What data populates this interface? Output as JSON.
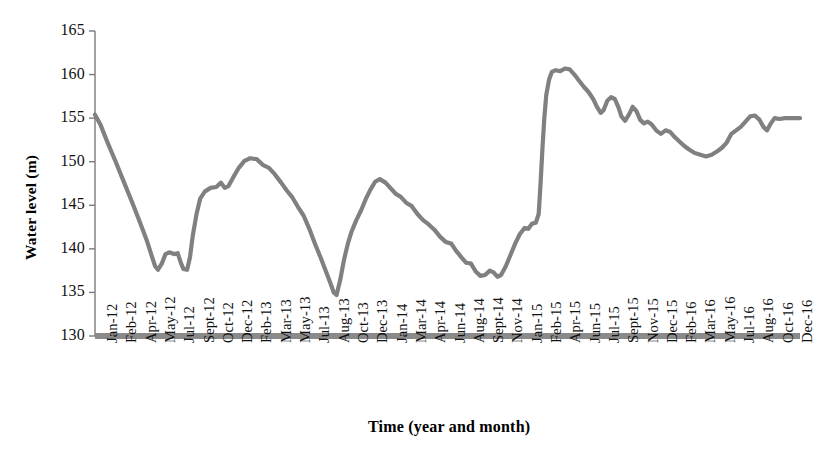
{
  "chart_data": {
    "type": "line",
    "title": "",
    "xlabel": "Time (year and month)",
    "ylabel": "Water level (m)",
    "ylim": [
      130,
      165
    ],
    "ytick_step": 5,
    "yticks": [
      130,
      135,
      140,
      145,
      150,
      155,
      160,
      165
    ],
    "grid": false,
    "legend": null,
    "line_color": "#808080",
    "axis_color": "#7a7a7a",
    "baseline_color": "#808080",
    "xtick_labels": [
      "Jan-12",
      "Feb-12",
      "Apr-12",
      "May-12",
      "Jul-12",
      "Sept-12",
      "Oct-12",
      "Dec-12",
      "Feb-13",
      "Mar-13",
      "May-13",
      "Jul-13",
      "Aug-13",
      "Oct-13",
      "Dec-13",
      "Jan-14",
      "Mar-14",
      "Apr-14",
      "Jun-14",
      "Aug-14",
      "Sept-14",
      "Nov-14",
      "Jan-15",
      "Feb-15",
      "Apr-15",
      "Jun-15",
      "Jul-15",
      "Sept-15",
      "Nov-15",
      "Dec-15",
      "Feb-16",
      "Mar-16",
      "May-16",
      "Jul-16",
      "Aug-16",
      "Oct-16",
      "Dec-16"
    ],
    "x": [
      "Jan-12",
      "Feb-12",
      "Mar-12",
      "Apr-12",
      "May-12",
      "Jun-12",
      "Jul-12",
      "Aug-12",
      "Sept-12",
      "Oct-12",
      "Nov-12",
      "Dec-12",
      "Jan-13",
      "Feb-13",
      "Mar-13",
      "Apr-13",
      "May-13",
      "Jun-13",
      "Jul-13",
      "Aug-13",
      "Sept-13",
      "Oct-13",
      "Nov-13",
      "Dec-13",
      "Jan-14",
      "Feb-14",
      "Mar-14",
      "Apr-14",
      "May-14",
      "Jun-14",
      "Jul-14",
      "Aug-14",
      "Sept-14",
      "Oct-14",
      "Nov-14",
      "Dec-14",
      "Jan-15",
      "Feb-15",
      "Mar-15",
      "Apr-15",
      "May-15",
      "Jun-15",
      "Jul-15",
      "Aug-15",
      "Sept-15",
      "Oct-15",
      "Nov-15",
      "Dec-15",
      "Jan-16",
      "Feb-16",
      "Mar-16",
      "Apr-16",
      "May-16",
      "Jun-16",
      "Jul-16",
      "Aug-16",
      "Sept-16",
      "Oct-16",
      "Nov-16",
      "Dec-16"
    ],
    "values": [
      155.4,
      152.0,
      148.3,
      144.6,
      141.0,
      138.0,
      139.4,
      140.4,
      139.0,
      138.4,
      140.9,
      146.3,
      147.4,
      147.6,
      147.0,
      148.3,
      150.2,
      150.4,
      150.1,
      149.0,
      147.8,
      146.3,
      144.5,
      142.0,
      139.4,
      136.8,
      134.7,
      138.6,
      143.0,
      145.0,
      147.0,
      148.0,
      147.2,
      146.0,
      145.5,
      144.6,
      143.4,
      142.3,
      141.6,
      140.6,
      139.4,
      138.3,
      137.5,
      137.0,
      137.5,
      136.8,
      138.0,
      140.0,
      142.2,
      142.8,
      143.0,
      152.5,
      158.4,
      160.3,
      160.7,
      160.5,
      160.6,
      159.6,
      158.3,
      157.0
    ],
    "series": [
      {
        "name": "Water level",
        "color": "#808080",
        "points": [
          {
            "t": 0.0,
            "v": 155.4
          },
          {
            "t": 0.6,
            "v": 154.2
          },
          {
            "t": 1.3,
            "v": 152.3
          },
          {
            "t": 2.2,
            "v": 150.0
          },
          {
            "t": 3.1,
            "v": 147.6
          },
          {
            "t": 4.0,
            "v": 145.2
          },
          {
            "t": 4.8,
            "v": 143.0
          },
          {
            "t": 5.5,
            "v": 141.0
          },
          {
            "t": 6.0,
            "v": 139.3
          },
          {
            "t": 6.4,
            "v": 138.0
          },
          {
            "t": 6.7,
            "v": 137.6
          },
          {
            "t": 7.1,
            "v": 138.3
          },
          {
            "t": 7.5,
            "v": 139.4
          },
          {
            "t": 7.9,
            "v": 139.6
          },
          {
            "t": 8.4,
            "v": 139.4
          },
          {
            "t": 8.8,
            "v": 139.5
          },
          {
            "t": 9.1,
            "v": 138.5
          },
          {
            "t": 9.4,
            "v": 137.7
          },
          {
            "t": 9.8,
            "v": 137.6
          },
          {
            "t": 10.1,
            "v": 139.0
          },
          {
            "t": 10.4,
            "v": 141.5
          },
          {
            "t": 10.8,
            "v": 144.0
          },
          {
            "t": 11.2,
            "v": 145.8
          },
          {
            "t": 11.7,
            "v": 146.6
          },
          {
            "t": 12.3,
            "v": 147.0
          },
          {
            "t": 12.9,
            "v": 147.1
          },
          {
            "t": 13.4,
            "v": 147.6
          },
          {
            "t": 13.8,
            "v": 147.0
          },
          {
            "t": 14.2,
            "v": 147.2
          },
          {
            "t": 14.7,
            "v": 148.2
          },
          {
            "t": 15.3,
            "v": 149.3
          },
          {
            "t": 15.9,
            "v": 150.1
          },
          {
            "t": 16.5,
            "v": 150.4
          },
          {
            "t": 17.2,
            "v": 150.3
          },
          {
            "t": 17.9,
            "v": 149.6
          },
          {
            "t": 18.5,
            "v": 149.3
          },
          {
            "t": 19.1,
            "v": 148.6
          },
          {
            "t": 19.8,
            "v": 147.6
          },
          {
            "t": 20.4,
            "v": 146.7
          },
          {
            "t": 21.0,
            "v": 145.9
          },
          {
            "t": 21.6,
            "v": 144.8
          },
          {
            "t": 22.2,
            "v": 143.8
          },
          {
            "t": 22.8,
            "v": 142.3
          },
          {
            "t": 23.4,
            "v": 140.6
          },
          {
            "t": 24.0,
            "v": 139.0
          },
          {
            "t": 24.5,
            "v": 137.6
          },
          {
            "t": 25.0,
            "v": 136.2
          },
          {
            "t": 25.4,
            "v": 135.0
          },
          {
            "t": 25.7,
            "v": 134.7
          },
          {
            "t": 26.1,
            "v": 136.5
          },
          {
            "t": 26.5,
            "v": 138.8
          },
          {
            "t": 26.9,
            "v": 140.6
          },
          {
            "t": 27.3,
            "v": 142.0
          },
          {
            "t": 27.8,
            "v": 143.3
          },
          {
            "t": 28.3,
            "v": 144.4
          },
          {
            "t": 28.8,
            "v": 145.7
          },
          {
            "t": 29.3,
            "v": 146.8
          },
          {
            "t": 29.8,
            "v": 147.7
          },
          {
            "t": 30.3,
            "v": 148.0
          },
          {
            "t": 30.9,
            "v": 147.6
          },
          {
            "t": 31.5,
            "v": 146.9
          },
          {
            "t": 32.0,
            "v": 146.3
          },
          {
            "t": 32.5,
            "v": 146.0
          },
          {
            "t": 33.1,
            "v": 145.3
          },
          {
            "t": 33.7,
            "v": 144.9
          },
          {
            "t": 34.3,
            "v": 144.0
          },
          {
            "t": 34.9,
            "v": 143.3
          },
          {
            "t": 35.5,
            "v": 142.8
          },
          {
            "t": 36.1,
            "v": 142.2
          },
          {
            "t": 36.7,
            "v": 141.4
          },
          {
            "t": 37.3,
            "v": 140.8
          },
          {
            "t": 37.9,
            "v": 140.6
          },
          {
            "t": 38.4,
            "v": 139.8
          },
          {
            "t": 39.0,
            "v": 139.0
          },
          {
            "t": 39.5,
            "v": 138.4
          },
          {
            "t": 40.0,
            "v": 138.3
          },
          {
            "t": 40.5,
            "v": 137.4
          },
          {
            "t": 41.0,
            "v": 136.9
          },
          {
            "t": 41.5,
            "v": 137.0
          },
          {
            "t": 42.0,
            "v": 137.5
          },
          {
            "t": 42.4,
            "v": 137.3
          },
          {
            "t": 42.8,
            "v": 136.8
          },
          {
            "t": 43.2,
            "v": 137.0
          },
          {
            "t": 43.7,
            "v": 138.0
          },
          {
            "t": 44.2,
            "v": 139.3
          },
          {
            "t": 44.7,
            "v": 140.6
          },
          {
            "t": 45.2,
            "v": 141.7
          },
          {
            "t": 45.7,
            "v": 142.4
          },
          {
            "t": 46.1,
            "v": 142.3
          },
          {
            "t": 46.5,
            "v": 142.9
          },
          {
            "t": 46.9,
            "v": 143.0
          },
          {
            "t": 47.2,
            "v": 144.0
          },
          {
            "t": 47.4,
            "v": 147.5
          },
          {
            "t": 47.6,
            "v": 151.5
          },
          {
            "t": 47.8,
            "v": 155.0
          },
          {
            "t": 48.0,
            "v": 157.6
          },
          {
            "t": 48.3,
            "v": 159.4
          },
          {
            "t": 48.6,
            "v": 160.3
          },
          {
            "t": 49.0,
            "v": 160.5
          },
          {
            "t": 49.5,
            "v": 160.4
          },
          {
            "t": 50.0,
            "v": 160.7
          },
          {
            "t": 50.5,
            "v": 160.6
          },
          {
            "t": 51.0,
            "v": 160.0
          },
          {
            "t": 51.5,
            "v": 159.3
          },
          {
            "t": 52.0,
            "v": 158.6
          },
          {
            "t": 52.5,
            "v": 158.0
          },
          {
            "t": 53.0,
            "v": 157.2
          },
          {
            "t": 53.4,
            "v": 156.3
          },
          {
            "t": 53.8,
            "v": 155.6
          },
          {
            "t": 54.1,
            "v": 155.9
          },
          {
            "t": 54.5,
            "v": 157.0
          },
          {
            "t": 54.9,
            "v": 157.4
          },
          {
            "t": 55.3,
            "v": 157.2
          },
          {
            "t": 55.7,
            "v": 156.2
          },
          {
            "t": 56.0,
            "v": 155.2
          },
          {
            "t": 56.4,
            "v": 154.7
          },
          {
            "t": 56.8,
            "v": 155.4
          },
          {
            "t": 57.2,
            "v": 156.3
          },
          {
            "t": 57.6,
            "v": 155.8
          },
          {
            "t": 58.0,
            "v": 154.8
          },
          {
            "t": 58.4,
            "v": 154.4
          },
          {
            "t": 58.8,
            "v": 154.6
          },
          {
            "t": 59.2,
            "v": 154.3
          },
          {
            "t": 59.7,
            "v": 153.6
          },
          {
            "t": 60.2,
            "v": 153.2
          },
          {
            "t": 60.7,
            "v": 153.6
          },
          {
            "t": 61.2,
            "v": 153.4
          },
          {
            "t": 61.7,
            "v": 152.8
          },
          {
            "t": 62.2,
            "v": 152.3
          },
          {
            "t": 62.7,
            "v": 151.8
          },
          {
            "t": 63.2,
            "v": 151.4
          },
          {
            "t": 63.8,
            "v": 151.0
          },
          {
            "t": 64.4,
            "v": 150.8
          },
          {
            "t": 65.0,
            "v": 150.6
          },
          {
            "t": 65.6,
            "v": 150.8
          },
          {
            "t": 66.2,
            "v": 151.2
          },
          {
            "t": 66.7,
            "v": 151.6
          },
          {
            "t": 67.2,
            "v": 152.2
          },
          {
            "t": 67.7,
            "v": 153.2
          },
          {
            "t": 68.2,
            "v": 153.6
          },
          {
            "t": 68.7,
            "v": 154.0
          },
          {
            "t": 69.2,
            "v": 154.6
          },
          {
            "t": 69.7,
            "v": 155.2
          },
          {
            "t": 70.2,
            "v": 155.3
          },
          {
            "t": 70.7,
            "v": 154.8
          },
          {
            "t": 71.1,
            "v": 154.0
          },
          {
            "t": 71.5,
            "v": 153.6
          },
          {
            "t": 71.9,
            "v": 154.4
          },
          {
            "t": 72.3,
            "v": 155.0
          },
          {
            "t": 72.8,
            "v": 154.9
          },
          {
            "t": 73.4,
            "v": 155.0
          },
          {
            "t": 74.0,
            "v": 155.0
          },
          {
            "t": 74.6,
            "v": 155.0
          },
          {
            "t": 75.0,
            "v": 155.0
          }
        ]
      }
    ]
  }
}
